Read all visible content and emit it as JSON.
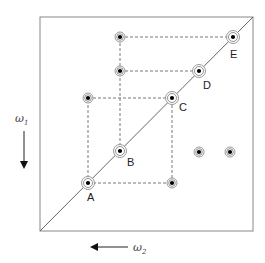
{
  "diagram": {
    "type": "2D spectrum / correlation map",
    "frame": {
      "x0": 40,
      "y0": 17,
      "x1": 253,
      "y1": 231,
      "color": "#888888"
    },
    "diagonal": {
      "x1": 40,
      "y1": 231,
      "x2": 253,
      "y2": 17,
      "color": "#555555"
    },
    "axes": {
      "vertical": {
        "label": "ω",
        "subscript": "1",
        "direction": "down"
      },
      "horizontal": {
        "label": "ω",
        "subscript": "2",
        "direction": "left"
      }
    },
    "diagonal_peaks": [
      {
        "id": "A",
        "label": "A",
        "x": 88,
        "y": 183,
        "lx": 87,
        "ly": 201
      },
      {
        "id": "B",
        "label": "B",
        "x": 120,
        "y": 151,
        "lx": 127,
        "ly": 166
      },
      {
        "id": "C",
        "label": "C",
        "x": 172,
        "y": 98,
        "lx": 179,
        "ly": 111
      },
      {
        "id": "D",
        "label": "D",
        "x": 199,
        "y": 71,
        "lx": 203,
        "ly": 89
      },
      {
        "id": "E",
        "label": "E",
        "x": 233,
        "y": 37,
        "lx": 230,
        "ly": 58
      }
    ],
    "cross_peaks": [
      {
        "id": "AC-upper",
        "x": 88,
        "y": 98
      },
      {
        "id": "AC-lower",
        "x": 172,
        "y": 183
      },
      {
        "id": "BD",
        "x": 120,
        "y": 71
      },
      {
        "id": "BE",
        "x": 120,
        "y": 37
      },
      {
        "id": "isolated-1",
        "x": 199,
        "y": 152
      },
      {
        "id": "isolated-2",
        "x": 230,
        "y": 152
      }
    ],
    "connectors": [
      {
        "from": "A",
        "to": "AC-upper",
        "x1": 88,
        "y1": 183,
        "x2": 88,
        "y2": 98
      },
      {
        "from": "AC-upper",
        "to": "C",
        "x1": 88,
        "y1": 98,
        "x2": 172,
        "y2": 98
      },
      {
        "from": "A",
        "to": "AC-lower",
        "x1": 88,
        "y1": 183,
        "x2": 172,
        "y2": 183
      },
      {
        "from": "AC-lower",
        "to": "C",
        "x1": 172,
        "y1": 183,
        "x2": 172,
        "y2": 98
      },
      {
        "from": "B",
        "to": "BD",
        "x1": 120,
        "y1": 151,
        "x2": 120,
        "y2": 71
      },
      {
        "from": "BD",
        "to": "D",
        "x1": 120,
        "y1": 71,
        "x2": 199,
        "y2": 71
      },
      {
        "from": "BD",
        "to": "BE",
        "x1": 120,
        "y1": 71,
        "x2": 120,
        "y2": 37
      },
      {
        "from": "BE",
        "to": "E",
        "x1": 120,
        "y1": 37,
        "x2": 233,
        "y2": 37
      }
    ]
  }
}
